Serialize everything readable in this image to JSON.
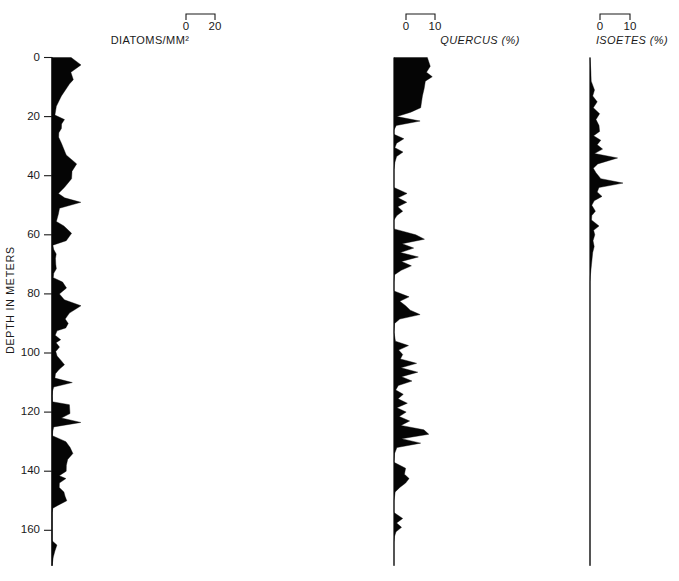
{
  "figure": {
    "background_color": "#ffffff",
    "ink_color": "#050505",
    "y_axis_title": "DEPTH IN METERS"
  },
  "chart_data": {
    "type": "area",
    "title": "",
    "subtitle": "",
    "orientation": "horizontal-depth-profile",
    "xlabel": "",
    "ylabel": "DEPTH IN METERS",
    "ylim": [
      0,
      172
    ],
    "y_inverted": true,
    "grid": false,
    "legend": "none",
    "y_ticks": [
      0,
      20,
      40,
      60,
      80,
      100,
      120,
      140,
      160
    ],
    "y_tick_labels": [
      "0",
      "20",
      "40",
      "60",
      "80",
      "100",
      "120",
      "140",
      "160"
    ],
    "panels": [
      {
        "name": "diatoms",
        "label": "DIATOMS/MM²",
        "label_style": "upright",
        "units": "",
        "scale_ticks": [
          0,
          20
        ],
        "scale_tick_labels": [
          "0",
          "20"
        ],
        "xlim": [
          0,
          20
        ],
        "x": "depth_m",
        "y": "value",
        "points": [
          [
            0,
            13.2
          ],
          [
            2.5,
            20.0
          ],
          [
            5,
            13.0
          ],
          [
            7.5,
            14.7
          ],
          [
            9,
            12.0
          ],
          [
            13,
            6.5
          ],
          [
            16.5,
            3.0
          ],
          [
            19.5,
            2.0
          ],
          [
            21,
            8.6
          ],
          [
            22.5,
            6.6
          ],
          [
            24,
            6.5
          ],
          [
            25.5,
            4.7
          ],
          [
            27,
            4.6
          ],
          [
            29,
            6.5
          ],
          [
            33,
            9.8
          ],
          [
            36,
            17.0
          ],
          [
            38.5,
            13.8
          ],
          [
            41,
            13.5
          ],
          [
            44,
            8.5
          ],
          [
            46,
            4.4
          ],
          [
            47.5,
            8.7
          ],
          [
            49,
            19.9
          ],
          [
            51,
            5.2
          ],
          [
            53,
            4.4
          ],
          [
            55.5,
            3.0
          ],
          [
            57,
            8.2
          ],
          [
            59.5,
            13.5
          ],
          [
            62,
            9.8
          ],
          [
            63.5,
            0.6
          ],
          [
            65,
            1.2
          ],
          [
            66.5,
            2.9
          ],
          [
            68,
            2.4
          ],
          [
            70,
            2.6
          ],
          [
            71.5,
            3.0
          ],
          [
            73,
            1.2
          ],
          [
            74.5,
            0.9
          ],
          [
            76,
            7.3
          ],
          [
            78,
            10.0
          ],
          [
            80,
            5.1
          ],
          [
            82,
            8.5
          ],
          [
            84,
            20.0
          ],
          [
            86.5,
            12.0
          ],
          [
            88.5,
            9.1
          ],
          [
            90,
            11.2
          ],
          [
            91.5,
            9.5
          ],
          [
            92.5,
            3.5
          ],
          [
            94,
            2.2
          ],
          [
            95.5,
            6.0
          ],
          [
            96.5,
            2.8
          ],
          [
            98,
            5.2
          ],
          [
            99.5,
            2.6
          ],
          [
            101,
            3.5
          ],
          [
            102.5,
            6.2
          ],
          [
            104,
            8.6
          ],
          [
            105.5,
            5.0
          ],
          [
            107,
            2.4
          ],
          [
            108.5,
            2.0
          ],
          [
            110,
            14.0
          ],
          [
            111.5,
            1.2
          ],
          [
            113,
            0.3
          ],
          [
            114.5,
            0.0
          ],
          [
            116.5,
            0.2
          ],
          [
            117.5,
            12.0
          ],
          [
            119,
            12.2
          ],
          [
            120.5,
            12.4
          ],
          [
            122,
            6.5
          ],
          [
            123.5,
            19.9
          ],
          [
            125,
            1.2
          ],
          [
            126.5,
            0.5
          ],
          [
            128,
            0.3
          ],
          [
            130,
            9.6
          ],
          [
            132,
            12.5
          ],
          [
            134,
            14.4
          ],
          [
            136,
            10.8
          ],
          [
            138,
            9.9
          ],
          [
            140,
            9.8
          ],
          [
            141.5,
            5.0
          ],
          [
            142.5,
            9.6
          ],
          [
            144,
            5.1
          ],
          [
            145.5,
            5.0
          ],
          [
            147,
            8.2
          ],
          [
            148.5,
            9.0
          ],
          [
            150,
            10.2
          ],
          [
            151.5,
            4.3
          ],
          [
            152.5,
            0.6
          ],
          [
            154,
            0.0
          ],
          [
            163.5,
            0.0
          ],
          [
            165,
            3.4
          ],
          [
            167,
            2.0
          ],
          [
            169,
            0.9
          ],
          [
            171,
            0.3
          ],
          [
            172,
            0.0
          ]
        ]
      },
      {
        "name": "quercus",
        "label": "QUERCUS  (%)",
        "label_style": "italic-genus",
        "units": "%",
        "scale_ticks": [
          0,
          10
        ],
        "scale_tick_labels": [
          "0",
          "10"
        ],
        "xlim": [
          0,
          10
        ],
        "x": "depth_m",
        "y": "percent",
        "points": [
          [
            0,
            11.5
          ],
          [
            3,
            12.5
          ],
          [
            5,
            11.2
          ],
          [
            6.5,
            13.2
          ],
          [
            8,
            10.8
          ],
          [
            10.5,
            10.4
          ],
          [
            13,
            9.8
          ],
          [
            15,
            9.5
          ],
          [
            17,
            9.2
          ],
          [
            18.5,
            5.8
          ],
          [
            20,
            1.0
          ],
          [
            21.5,
            9.0
          ],
          [
            23,
            0.8
          ],
          [
            24.5,
            0.0
          ],
          [
            26,
            0.0
          ],
          [
            27.5,
            3.4
          ],
          [
            29,
            0.9
          ],
          [
            30.5,
            0.3
          ],
          [
            32,
            3.1
          ],
          [
            33.5,
            0.9
          ],
          [
            35.5,
            0.3
          ],
          [
            38,
            0.0
          ],
          [
            44,
            0.0
          ],
          [
            46,
            4.5
          ],
          [
            47.5,
            1.4
          ],
          [
            49,
            4.4
          ],
          [
            50.5,
            1.3
          ],
          [
            52,
            3.0
          ],
          [
            53.5,
            1.0
          ],
          [
            55,
            0.0
          ],
          [
            58,
            0.0
          ],
          [
            60,
            7.5
          ],
          [
            61.5,
            10.5
          ],
          [
            63,
            2.8
          ],
          [
            64.5,
            6.8
          ],
          [
            66,
            2.2
          ],
          [
            67.5,
            8.4
          ],
          [
            69,
            2.6
          ],
          [
            70.5,
            6.0
          ],
          [
            72,
            2.5
          ],
          [
            73.5,
            0.2
          ],
          [
            76,
            0.0
          ],
          [
            79,
            0.0
          ],
          [
            81,
            5.2
          ],
          [
            82.5,
            2.0
          ],
          [
            84,
            4.0
          ],
          [
            85.5,
            5.6
          ],
          [
            87,
            9.0
          ],
          [
            88.5,
            2.0
          ],
          [
            90,
            0.2
          ],
          [
            93,
            0.0
          ],
          [
            96,
            0.5
          ],
          [
            97.5,
            5.0
          ],
          [
            99,
            1.6
          ],
          [
            100.5,
            3.0
          ],
          [
            102,
            2.2
          ],
          [
            103.5,
            7.8
          ],
          [
            105,
            2.4
          ],
          [
            106.5,
            8.2
          ],
          [
            108,
            2.6
          ],
          [
            109.5,
            6.2
          ],
          [
            111,
            1.5
          ],
          [
            112.5,
            0.6
          ],
          [
            114,
            3.2
          ],
          [
            115.5,
            1.4
          ],
          [
            117,
            4.6
          ],
          [
            118.5,
            1.0
          ],
          [
            120,
            4.2
          ],
          [
            121.5,
            1.8
          ],
          [
            123,
            5.4
          ],
          [
            124.5,
            2.4
          ],
          [
            126,
            10.3
          ],
          [
            127.5,
            12.0
          ],
          [
            129,
            2.6
          ],
          [
            130.5,
            9.2
          ],
          [
            132,
            1.0
          ],
          [
            134,
            0.2
          ],
          [
            137,
            0.0
          ],
          [
            139,
            4.0
          ],
          [
            141,
            3.6
          ],
          [
            142.5,
            5.2
          ],
          [
            144,
            4.0
          ],
          [
            145.5,
            2.0
          ],
          [
            147,
            0.4
          ],
          [
            150,
            0.0
          ],
          [
            154,
            0.0
          ],
          [
            156,
            3.0
          ],
          [
            157.5,
            0.9
          ],
          [
            159,
            2.6
          ],
          [
            160.5,
            0.7
          ],
          [
            162,
            0.2
          ],
          [
            164,
            0.0
          ],
          [
            172,
            0.0
          ]
        ]
      },
      {
        "name": "isoetes",
        "label": "ISOETES (%)",
        "label_style": "italic-genus",
        "units": "%",
        "scale_ticks": [
          0,
          10
        ],
        "scale_tick_labels": [
          "0",
          "10"
        ],
        "xlim": [
          0,
          10
        ],
        "x": "depth_m",
        "y": "percent",
        "points": [
          [
            0,
            0.0
          ],
          [
            5,
            0.3
          ],
          [
            8,
            0.4
          ],
          [
            11,
            1.5
          ],
          [
            13,
            0.9
          ],
          [
            15,
            2.4
          ],
          [
            17,
            1.1
          ],
          [
            19,
            3.2
          ],
          [
            21,
            2.0
          ],
          [
            23,
            3.0
          ],
          [
            25,
            3.2
          ],
          [
            26.5,
            1.2
          ],
          [
            28,
            3.6
          ],
          [
            29.5,
            2.4
          ],
          [
            31,
            4.2
          ],
          [
            32.5,
            1.5
          ],
          [
            34,
            9.2
          ],
          [
            36,
            2.6
          ],
          [
            37.5,
            1.1
          ],
          [
            39,
            2.0
          ],
          [
            41,
            3.6
          ],
          [
            42.5,
            11.0
          ],
          [
            44,
            3.0
          ],
          [
            45.5,
            2.4
          ],
          [
            47,
            4.0
          ],
          [
            48.5,
            1.4
          ],
          [
            50,
            0.6
          ],
          [
            52,
            1.8
          ],
          [
            53.5,
            0.6
          ],
          [
            55,
            0.5
          ],
          [
            57,
            3.0
          ],
          [
            58.5,
            1.2
          ],
          [
            60,
            1.6
          ],
          [
            62,
            1.0
          ],
          [
            64,
            1.4
          ],
          [
            66,
            0.9
          ],
          [
            68,
            0.7
          ],
          [
            70,
            0.5
          ],
          [
            72,
            0.3
          ],
          [
            74,
            0.1
          ],
          [
            76,
            0.0
          ],
          [
            90,
            0.0
          ],
          [
            120,
            0.0
          ],
          [
            150,
            0.0
          ],
          [
            172,
            0.0
          ]
        ]
      }
    ]
  }
}
